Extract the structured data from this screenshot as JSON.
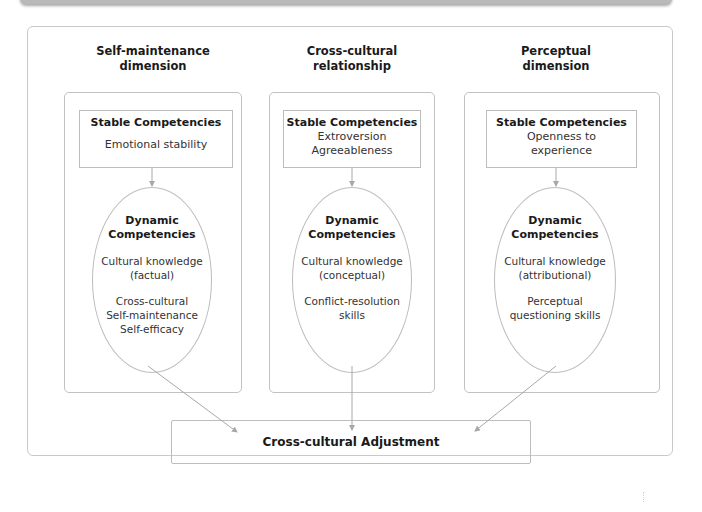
{
  "diagram": {
    "dimensions": [
      {
        "title_line1": "Self-maintenance",
        "title_line2": "dimension",
        "stable": {
          "heading": "Stable Competencies",
          "items": [
            "Emotional stability"
          ]
        },
        "dynamic": {
          "heading_line1": "Dynamic",
          "heading_line2": "Competencies",
          "group1": [
            "Cultural knowledge",
            "(factual)"
          ],
          "group2": [
            "Cross-cultural",
            "Self-maintenance",
            "Self-efficacy"
          ]
        }
      },
      {
        "title_line1": "Cross-cultural",
        "title_line2": "relationship",
        "stable": {
          "heading": "Stable Competencies",
          "items": [
            "Extroversion",
            "Agreeableness"
          ]
        },
        "dynamic": {
          "heading_line1": "Dynamic",
          "heading_line2": "Competencies",
          "group1": [
            "Cultural knowledge",
            "(conceptual)"
          ],
          "group2": [
            "Conflict-resolution",
            "skills"
          ]
        }
      },
      {
        "title_line1": "Perceptual",
        "title_line2": "dimension",
        "stable": {
          "heading": "Stable Competencies",
          "items": [
            "Openness to",
            "experience"
          ]
        },
        "dynamic": {
          "heading_line1": "Dynamic",
          "heading_line2": "Competencies",
          "group1": [
            "Cultural knowledge",
            "(attributional)"
          ],
          "group2": [
            "Perceptual",
            "questioning skills"
          ]
        }
      }
    ],
    "outcome": "Cross-cultural Adjustment",
    "colors": {
      "border": "#bdbdbd",
      "arrow": "#a8a8a8",
      "text": "#1a1a1a"
    }
  }
}
